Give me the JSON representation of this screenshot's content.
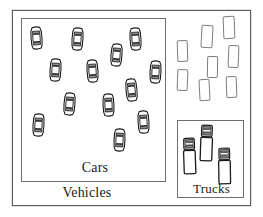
{
  "diagram": {
    "type": "nested-set-diagram",
    "outer_set": {
      "name": "vehicles",
      "label": "Vehicles",
      "rect": {
        "x": 12,
        "y": 10,
        "w": 239,
        "h": 196
      }
    },
    "subsets": [
      {
        "name": "cars",
        "label": "Cars",
        "rect": {
          "x": 21,
          "y": 18,
          "w": 145,
          "h": 164
        },
        "item_icon": "car-icon",
        "item_count": 13
      },
      {
        "name": "trucks",
        "label": "Trucks",
        "rect": {
          "x": 177,
          "y": 120,
          "w": 67,
          "h": 78
        },
        "item_icon": "truck-icon",
        "item_count": 3
      }
    ],
    "unclassified": {
      "name": "other-vehicles",
      "item_icon": "blank-rectangle-icon",
      "item_count": 8
    }
  },
  "labels": {
    "vehicles": "Vehicles",
    "cars": "Cars",
    "trucks": "Trucks"
  },
  "label_positions": {
    "vehicles": {
      "x": 57,
      "y": 185,
      "w": 60
    },
    "cars": {
      "x": 78,
      "y": 160,
      "w": 34
    },
    "trucks": {
      "x": 188,
      "y": 182,
      "w": 47
    }
  },
  "colors": {
    "background": "#ffffff",
    "outer_border": "#5a5a5a",
    "inner_border": "#6e6e6e",
    "icon_stroke": "#1a1a1a",
    "icon_fill": "#ffffff",
    "icon_shade": "#8c8c8c",
    "plain_rect_border": "#7d7d7d",
    "label_text": "#1a1a1a"
  },
  "cars": [
    {
      "id": "car-1",
      "x": 30,
      "y": 26,
      "rot": -4
    },
    {
      "id": "car-2",
      "x": 71,
      "y": 27,
      "rot": 3
    },
    {
      "id": "car-3",
      "x": 129,
      "y": 27,
      "rot": -3
    },
    {
      "id": "car-4",
      "x": 110,
      "y": 43,
      "rot": 4
    },
    {
      "id": "car-5",
      "x": 49,
      "y": 58,
      "rot": 3
    },
    {
      "id": "car-6",
      "x": 86,
      "y": 59,
      "rot": -3
    },
    {
      "id": "car-7",
      "x": 149,
      "y": 60,
      "rot": 2
    },
    {
      "id": "car-8",
      "x": 125,
      "y": 78,
      "rot": -5
    },
    {
      "id": "car-9",
      "x": 63,
      "y": 92,
      "rot": 4
    },
    {
      "id": "car-10",
      "x": 102,
      "y": 93,
      "rot": -2
    },
    {
      "id": "car-11",
      "x": 32,
      "y": 113,
      "rot": 3
    },
    {
      "id": "car-12",
      "x": 137,
      "y": 110,
      "rot": -3
    },
    {
      "id": "car-13",
      "x": 113,
      "y": 128,
      "rot": 2
    }
  ],
  "trucks": [
    {
      "id": "truck-1",
      "x": 182,
      "y": 137,
      "rot": -2
    },
    {
      "id": "truck-2",
      "x": 199,
      "y": 124,
      "rot": 2
    },
    {
      "id": "truck-3",
      "x": 217,
      "y": 147,
      "rot": -1
    }
  ],
  "blank_rects": [
    {
      "id": "rect-1",
      "x": 177,
      "y": 40,
      "w": 11,
      "h": 22,
      "rot": -2
    },
    {
      "id": "rect-2",
      "x": 177,
      "y": 69,
      "w": 11,
      "h": 22,
      "rot": 2
    },
    {
      "id": "rect-3",
      "x": 201,
      "y": 25,
      "w": 12,
      "h": 23,
      "rot": 3
    },
    {
      "id": "rect-4",
      "x": 199,
      "y": 79,
      "w": 11,
      "h": 22,
      "rot": -3
    },
    {
      "id": "rect-5",
      "x": 223,
      "y": 16,
      "w": 12,
      "h": 23,
      "rot": -2
    },
    {
      "id": "rect-6",
      "x": 228,
      "y": 45,
      "w": 11,
      "h": 23,
      "rot": 2
    },
    {
      "id": "rect-7",
      "x": 207,
      "y": 56,
      "w": 11,
      "h": 22,
      "rot": 1
    },
    {
      "id": "rect-8",
      "x": 226,
      "y": 76,
      "w": 11,
      "h": 22,
      "rot": -2
    }
  ]
}
